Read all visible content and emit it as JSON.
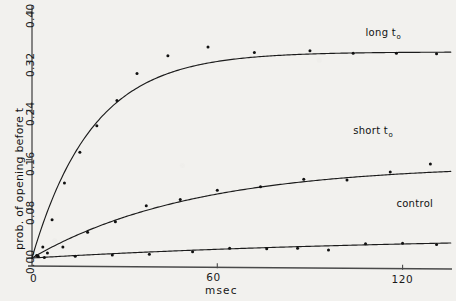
{
  "chart_data": {
    "type": "line",
    "title": "",
    "xlabel": "msec",
    "ylabel": "prob. of opening before t",
    "xlim": [
      0,
      136
    ],
    "ylim": [
      0.0,
      0.42
    ],
    "xticks": [
      0,
      60,
      120
    ],
    "xtick_labels": [
      "0",
      "60",
      "120"
    ],
    "yticks": [
      0.0,
      0.08,
      0.16,
      0.24,
      0.32,
      0.4
    ],
    "ytick_labels": [
      "0.00",
      "0.08",
      "0.16",
      "0.24",
      "0.32",
      "0.40"
    ],
    "grid": false,
    "legend_position": "inline-annotations",
    "annotations": [
      {
        "text": "long t",
        "subscript": "o",
        "x": 108,
        "y": 0.365
      },
      {
        "text": "short t",
        "subscript": "o",
        "x": 104,
        "y": 0.205
      },
      {
        "text": "control",
        "subscript": "",
        "x": 118,
        "y": 0.086
      }
    ],
    "series": [
      {
        "name": "long t_o",
        "label": "long t",
        "label_subscript": "o",
        "model": "saturating_exponential",
        "plateau": 0.335,
        "rate_tau_msec": 19.5,
        "points": [
          {
            "x": 1.5,
            "y": 0.004
          },
          {
            "x": 3.5,
            "y": 0.018
          },
          {
            "x": 6.5,
            "y": 0.062
          },
          {
            "x": 10.5,
            "y": 0.122
          },
          {
            "x": 15.5,
            "y": 0.172
          },
          {
            "x": 21.0,
            "y": 0.215
          },
          {
            "x": 27.5,
            "y": 0.256
          },
          {
            "x": 34.0,
            "y": 0.3
          },
          {
            "x": 44.0,
            "y": 0.329
          },
          {
            "x": 57.0,
            "y": 0.343
          },
          {
            "x": 72.0,
            "y": 0.334
          },
          {
            "x": 90.0,
            "y": 0.337
          },
          {
            "x": 104.0,
            "y": 0.333
          },
          {
            "x": 118.0,
            "y": 0.333
          },
          {
            "x": 131.0,
            "y": 0.332
          }
        ]
      },
      {
        "name": "short t_o",
        "label": "short t",
        "label_subscript": "o",
        "model": "saturating_exponential",
        "plateau": 0.152,
        "rate_tau_msec": 52.0,
        "points": [
          {
            "x": 2.0,
            "y": 0.003
          },
          {
            "x": 5.0,
            "y": 0.008
          },
          {
            "x": 10.0,
            "y": 0.018
          },
          {
            "x": 18.0,
            "y": 0.042
          },
          {
            "x": 27.0,
            "y": 0.059
          },
          {
            "x": 37.0,
            "y": 0.085
          },
          {
            "x": 48.0,
            "y": 0.095
          },
          {
            "x": 60.0,
            "y": 0.11
          },
          {
            "x": 74.0,
            "y": 0.116
          },
          {
            "x": 88.0,
            "y": 0.128
          },
          {
            "x": 102.0,
            "y": 0.127
          },
          {
            "x": 116.0,
            "y": 0.14
          },
          {
            "x": 129.0,
            "y": 0.153
          }
        ]
      },
      {
        "name": "control",
        "label": "control",
        "label_subscript": "",
        "model": "saturating_exponential",
        "plateau": 0.036,
        "rate_tau_msec": 120.0,
        "points": [
          {
            "x": 4.0,
            "y": 0.001
          },
          {
            "x": 14.0,
            "y": 0.003
          },
          {
            "x": 26.0,
            "y": 0.005
          },
          {
            "x": 38.0,
            "y": 0.006
          },
          {
            "x": 52.0,
            "y": 0.01
          },
          {
            "x": 64.0,
            "y": 0.016
          },
          {
            "x": 76.0,
            "y": 0.015
          },
          {
            "x": 86.0,
            "y": 0.016
          },
          {
            "x": 96.0,
            "y": 0.013
          },
          {
            "x": 108.0,
            "y": 0.023
          },
          {
            "x": 120.0,
            "y": 0.024
          },
          {
            "x": 131.0,
            "y": 0.022
          }
        ]
      }
    ]
  },
  "axes": {
    "x_axis_name": "time-axis",
    "y_axis_name": "probability-axis",
    "origin_label": "0"
  }
}
